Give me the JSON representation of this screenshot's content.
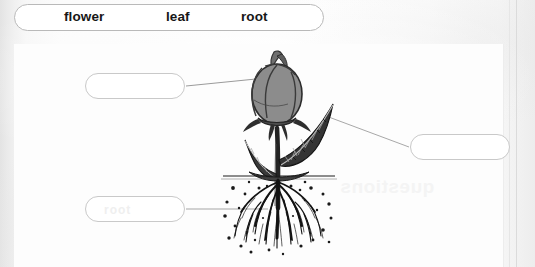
{
  "worksheet": {
    "background_color": "#f2f2f2",
    "card_color": "#fdfdfd"
  },
  "word_bank": {
    "name": "word-bank",
    "words": [
      {
        "label": "flower"
      },
      {
        "label": "leaf"
      },
      {
        "label": "root"
      }
    ]
  },
  "answer_boxes": [
    {
      "id": "flower",
      "value": "",
      "placeholder": "",
      "target": "flower-bud",
      "ghost": "    "
    },
    {
      "id": "leaf",
      "value": "",
      "placeholder": "",
      "target": "leaf",
      "ghost": ""
    },
    {
      "id": "root",
      "value": "",
      "placeholder": "",
      "target": "root-system",
      "ghost": "root"
    }
  ],
  "artifacts": {
    "bleed_through_text": "questions"
  },
  "illustration": {
    "name": "rose-plant-diagram",
    "parts": [
      {
        "name": "flower-bud",
        "color": "#8c8c8c"
      },
      {
        "name": "stem",
        "color": "#2e2e2e"
      },
      {
        "name": "leaf",
        "color": "#3a3a3a"
      },
      {
        "name": "soil-line",
        "color": "#1d1d1d"
      },
      {
        "name": "root-system",
        "color": "#171717"
      }
    ]
  }
}
